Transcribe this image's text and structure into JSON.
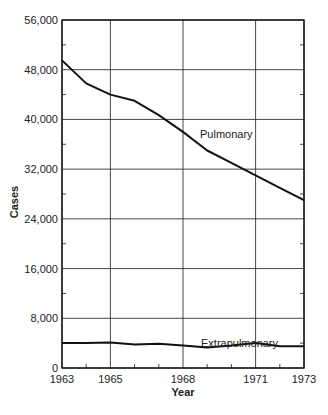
{
  "chart_data": {
    "type": "line",
    "title": "",
    "xlabel": "Year",
    "ylabel": "Cases",
    "xlim": [
      1963,
      1973
    ],
    "ylim": [
      0,
      56000
    ],
    "grid": true,
    "legend": "inline labels",
    "x": [
      1963,
      1964,
      1965,
      1966,
      1967,
      1968,
      1969,
      1970,
      1971,
      1972,
      1973
    ],
    "x_tick_labels": [
      "1963",
      "1965",
      "1968",
      "1971",
      "1973"
    ],
    "x_tick_values": [
      1963,
      1965,
      1968,
      1971,
      1973
    ],
    "y_tick_labels": [
      "0",
      "8,000",
      "16,000",
      "24,000",
      "32,000",
      "40,000",
      "48,000",
      "56,000"
    ],
    "y_tick_values": [
      0,
      8000,
      16000,
      24000,
      32000,
      40000,
      48000,
      56000
    ],
    "series": [
      {
        "name": "Pulmonary",
        "values": [
          49500,
          45800,
          44000,
          43000,
          40700,
          38000,
          35000,
          33000,
          31000,
          29000,
          27000
        ]
      },
      {
        "name": "Extrapulmonary",
        "values": [
          4000,
          4000,
          4100,
          3800,
          3900,
          3600,
          3300,
          3600,
          4000,
          3500,
          3500
        ]
      }
    ]
  }
}
